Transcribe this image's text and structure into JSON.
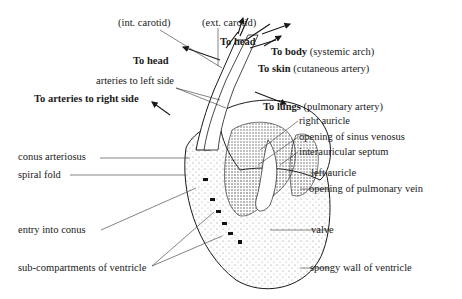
{
  "diagram": {
    "labels": {
      "int_carotid": "(int. carotid)",
      "ext_carotid": "(ext. carotid)",
      "to_head_top": "To head",
      "to_head_left": "To head",
      "to_body": "To body",
      "to_body_note": "(systemic arch)",
      "to_skin": "To skin",
      "to_skin_note": "(cutaneous artery)",
      "arteries_left": "arteries to left side",
      "arteries_right": "To arteries to right side",
      "to_lungs": "To lungs",
      "to_lungs_note": "(pulmonary artery)",
      "right_auricle": "right auricle",
      "sinus_venosus": "opening of sinus venosus",
      "interauricular": "interauricular septum",
      "conus": "conus arteriosus",
      "left_auricle": "left auricle",
      "spiral_fold": "spiral fold",
      "pulmonary_vein": "opening of pulmonary vein",
      "entry_conus": "entry into conus",
      "valve": "valve",
      "sub_compartments": "sub-compartments of ventricle",
      "spongy_wall": "spongy wall of ventricle"
    },
    "colors": {
      "ink": "#1a1a1a",
      "stipple": "#777777",
      "background": "#ffffff"
    }
  }
}
